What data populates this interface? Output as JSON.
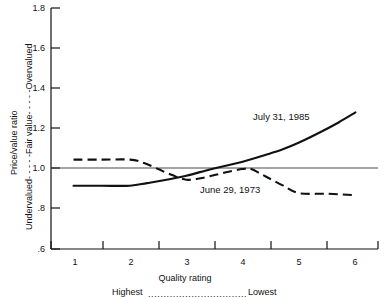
{
  "chart_data": {
    "type": "line",
    "title": "",
    "xlabel": "Quality rating",
    "ylabel": "Price/value ratio",
    "ylabel_secondary": "Undervalued- - - - -Fair value- - - - -Overvalued",
    "xlim": [
      0.6,
      6.4
    ],
    "ylim": [
      0.6,
      1.8
    ],
    "grid": false,
    "legend_position": "inline-annotation",
    "reference_line": {
      "y": 1.0,
      "label": "Fair value"
    },
    "y_ticks": [
      "1.8",
      "1.6",
      "1.4",
      "1.2",
      "1.0",
      ".8",
      ".6"
    ],
    "y_tick_values": [
      1.8,
      1.6,
      1.4,
      1.2,
      1.0,
      0.8,
      0.6
    ],
    "x_ticks": [
      "1",
      "2",
      "3",
      "4",
      "5",
      "6"
    ],
    "x_tick_values": [
      1,
      2,
      3,
      4,
      5,
      6
    ],
    "x_scale_note_left": "Highest",
    "x_scale_note_right": "Lowest",
    "x_scale_note_dots": "................................",
    "categories": [
      1,
      2,
      3,
      4,
      5,
      6
    ],
    "series": [
      {
        "name": "July 31, 1985",
        "style": "solid",
        "color": "#111111",
        "values": [
          0.915,
          0.915,
          0.965,
          1.035,
          1.13,
          1.28
        ],
        "points": [
          [
            1.0,
            0.915
          ],
          [
            1.5,
            0.915
          ],
          [
            2.0,
            0.915
          ],
          [
            2.3,
            0.928
          ],
          [
            2.6,
            0.942
          ],
          [
            3.0,
            0.965
          ],
          [
            3.4,
            0.995
          ],
          [
            3.7,
            1.015
          ],
          [
            4.0,
            1.035
          ],
          [
            4.4,
            1.068
          ],
          [
            4.7,
            1.095
          ],
          [
            5.0,
            1.13
          ],
          [
            5.4,
            1.185
          ],
          [
            5.7,
            1.23
          ],
          [
            6.0,
            1.28
          ]
        ]
      },
      {
        "name": "June 29, 1973",
        "style": "dashed",
        "color": "#111111",
        "values": [
          1.045,
          1.045,
          0.945,
          0.998,
          0.878,
          0.868
        ],
        "points": [
          [
            1.0,
            1.045
          ],
          [
            1.5,
            1.045
          ],
          [
            2.0,
            1.045
          ],
          [
            2.25,
            1.028
          ],
          [
            2.5,
            0.998
          ],
          [
            2.75,
            0.968
          ],
          [
            3.0,
            0.945
          ],
          [
            3.25,
            0.952
          ],
          [
            3.5,
            0.968
          ],
          [
            3.75,
            0.985
          ],
          [
            4.0,
            0.998
          ],
          [
            4.15,
            0.998
          ],
          [
            4.4,
            0.962
          ],
          [
            4.7,
            0.918
          ],
          [
            5.0,
            0.878
          ],
          [
            5.5,
            0.875
          ],
          [
            6.0,
            0.868
          ]
        ]
      }
    ],
    "annotations": [
      {
        "text": "July 31, 1985",
        "x": 4.05,
        "y": 1.215
      },
      {
        "text": "June 29, 1973",
        "x": 3.2,
        "y": 0.875
      }
    ]
  }
}
